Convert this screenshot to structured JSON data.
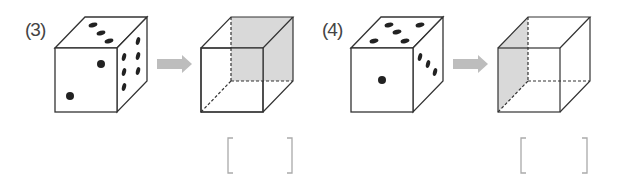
{
  "problems": [
    {
      "label": "(3)",
      "die": {
        "front_face_pips": 2,
        "top_face_pips": 3,
        "right_face_pips": 6
      },
      "answer_cube": {
        "shaded_face": "back"
      },
      "answer_box": ""
    },
    {
      "label": "(4)",
      "die": {
        "front_face_pips": 1,
        "top_face_pips": 5,
        "right_face_pips": 3
      },
      "answer_cube": {
        "shaded_face": "left"
      },
      "answer_box": ""
    }
  ],
  "colors": {
    "line": "#333333",
    "pip": "#222222",
    "shade": "#d9d9d9",
    "arrow": "#bdbdbd",
    "bracket": "#aaaaaa"
  }
}
